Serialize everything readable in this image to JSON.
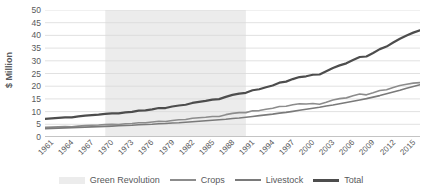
{
  "chart_data": {
    "type": "line",
    "title": "",
    "xlabel": "",
    "ylabel": "$ Million",
    "ylim": [
      0,
      50
    ],
    "ytick_values": [
      0,
      5,
      10,
      15,
      20,
      25,
      30,
      35,
      40,
      45,
      50
    ],
    "xlim": [
      1961,
      2017
    ],
    "grid": "horizontal",
    "legend_position": "bottom",
    "xtick_labels": [
      "1961",
      "1964",
      "1967",
      "1970",
      "1973",
      "1976",
      "1979",
      "1982",
      "1985",
      "1988",
      "1991",
      "1994",
      "1997",
      "2000",
      "2003",
      "2006",
      "2009",
      "2012",
      "2015"
    ],
    "x": [
      1961,
      1962,
      1963,
      1964,
      1965,
      1966,
      1967,
      1968,
      1969,
      1970,
      1971,
      1972,
      1973,
      1974,
      1975,
      1976,
      1977,
      1978,
      1979,
      1980,
      1981,
      1982,
      1983,
      1984,
      1985,
      1986,
      1987,
      1988,
      1989,
      1990,
      1991,
      1992,
      1993,
      1994,
      1995,
      1996,
      1997,
      1998,
      1999,
      2000,
      2001,
      2002,
      2003,
      2004,
      2005,
      2006,
      2007,
      2008,
      2009,
      2010,
      2011,
      2012,
      2013,
      2014,
      2015,
      2016,
      2017
    ],
    "series": [
      {
        "name": "Crops",
        "color": "#8c8c8c",
        "width": 1.6,
        "values": [
          3.8,
          3.9,
          4.0,
          4.1,
          4.0,
          4.3,
          4.5,
          4.6,
          4.7,
          4.9,
          5.0,
          4.9,
          5.2,
          5.3,
          5.6,
          5.6,
          5.9,
          6.2,
          6.1,
          6.5,
          6.8,
          6.9,
          7.4,
          7.6,
          7.8,
          8.1,
          8.1,
          8.8,
          9.3,
          9.6,
          9.6,
          10.3,
          10.4,
          10.9,
          11.3,
          12.0,
          12.1,
          12.7,
          13.1,
          13.0,
          13.2,
          12.9,
          13.7,
          14.6,
          15.1,
          15.4,
          16.2,
          16.9,
          16.6,
          17.4,
          18.3,
          18.6,
          19.5,
          20.3,
          20.8,
          21.2,
          21.4
        ]
      },
      {
        "name": "Livestock",
        "color": "#7a7a7a",
        "width": 1.6,
        "values": [
          3.3,
          3.4,
          3.5,
          3.6,
          3.7,
          3.8,
          3.9,
          4.0,
          4.1,
          4.2,
          4.3,
          4.4,
          4.5,
          4.6,
          4.8,
          4.9,
          5.0,
          5.2,
          5.3,
          5.5,
          5.6,
          5.8,
          6.0,
          6.2,
          6.4,
          6.6,
          6.8,
          7.0,
          7.3,
          7.5,
          7.8,
          8.1,
          8.4,
          8.7,
          9.0,
          9.4,
          9.7,
          10.1,
          10.5,
          10.9,
          11.3,
          11.7,
          12.2,
          12.6,
          13.1,
          13.6,
          14.1,
          14.6,
          15.1,
          15.7,
          16.3,
          17.0,
          17.7,
          18.4,
          19.2,
          19.9,
          20.6
        ]
      },
      {
        "name": "Total",
        "color": "#4d4d4d",
        "width": 2.2,
        "values": [
          7.1,
          7.3,
          7.5,
          7.7,
          7.7,
          8.1,
          8.4,
          8.6,
          8.8,
          9.1,
          9.3,
          9.3,
          9.7,
          9.9,
          10.4,
          10.5,
          10.9,
          11.4,
          11.4,
          12.0,
          12.4,
          12.7,
          13.4,
          13.8,
          14.2,
          14.7,
          14.9,
          15.8,
          16.6,
          17.1,
          17.4,
          18.4,
          18.8,
          19.6,
          20.3,
          21.4,
          21.8,
          22.8,
          23.6,
          23.9,
          24.5,
          24.6,
          25.9,
          27.2,
          28.2,
          29.0,
          30.3,
          31.5,
          31.7,
          33.1,
          34.6,
          35.6,
          37.2,
          38.7,
          40.0,
          41.1,
          42.0
        ]
      }
    ],
    "bands": [
      {
        "name": "Green Revolution",
        "color": "#ececec",
        "x_start": 1970,
        "x_end": 1991
      }
    ]
  },
  "legend": {
    "items": [
      {
        "label": "Green Revolution",
        "type": "band",
        "color": "#ececec"
      },
      {
        "label": "Crops",
        "type": "line",
        "color": "#8c8c8c",
        "width": 2
      },
      {
        "label": "Livestock",
        "type": "line",
        "color": "#7a7a7a",
        "width": 2
      },
      {
        "label": "Total",
        "type": "line",
        "color": "#4d4d4d",
        "width": 3
      }
    ]
  },
  "axes": {
    "y_title": "$ Million",
    "gridline_color": "#d9d9d9",
    "axis_line_color": "#bfbfbf"
  }
}
